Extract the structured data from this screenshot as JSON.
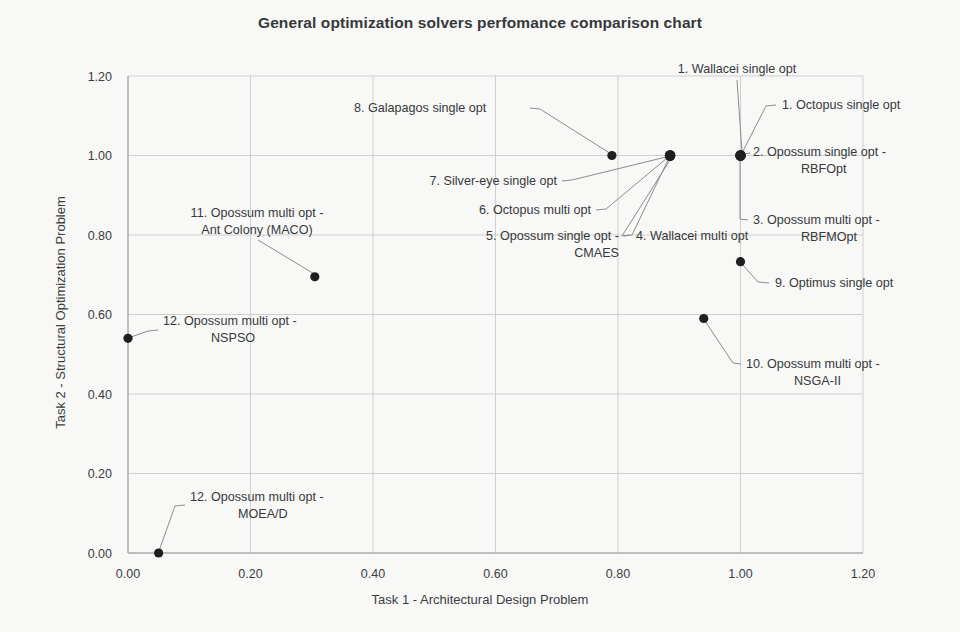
{
  "chart_data": {
    "type": "scatter",
    "title": "General optimization solvers perfomance comparison chart",
    "xlabel": "Task 1 - Architectural Design Problem",
    "ylabel": "Task 2 - Structural Optimization Problem",
    "xlim": [
      0.0,
      1.2
    ],
    "ylim": [
      0.0,
      1.2
    ],
    "xticks": [
      "0.00",
      "0.20",
      "0.40",
      "0.60",
      "0.80",
      "1.00",
      "1.20"
    ],
    "yticks": [
      "0.00",
      "0.20",
      "0.40",
      "0.60",
      "0.80",
      "1.00",
      "1.20"
    ],
    "xtick_values": [
      0.0,
      0.2,
      0.4,
      0.6,
      0.8,
      1.0,
      1.2
    ],
    "ytick_values": [
      0.0,
      0.2,
      0.4,
      0.6,
      0.8,
      1.0,
      1.2
    ],
    "grid": true,
    "legend": "none",
    "marker_color": "#1f1f1f",
    "grid_color": "#cfcfcf",
    "points": [
      {
        "label": "1. Wallacei single opt",
        "x": 1.0,
        "y": 1.0
      },
      {
        "label": "1. Octopus single opt",
        "x": 1.0,
        "y": 1.0
      },
      {
        "label": "2. Opossum single opt - RBFOpt",
        "x": 1.0,
        "y": 1.0
      },
      {
        "label": "3. Opossum multi opt - RBFMOpt",
        "x": 1.0,
        "y": 1.0
      },
      {
        "label": "4. Wallacei multi opt",
        "x": 0.885,
        "y": 1.0
      },
      {
        "label": "5. Opossum single opt - CMAES",
        "x": 0.885,
        "y": 1.0
      },
      {
        "label": "6. Octopus multi opt",
        "x": 0.885,
        "y": 1.0
      },
      {
        "label": "7. Silver-eye single opt",
        "x": 0.885,
        "y": 1.0
      },
      {
        "label": "8. Galapagos single opt",
        "x": 0.79,
        "y": 1.0
      },
      {
        "label": "9. Optimus single opt",
        "x": 1.0,
        "y": 0.733
      },
      {
        "label": "10. Opossum multi opt - NSGA-II",
        "x": 0.94,
        "y": 0.59
      },
      {
        "label": "11. Opossum multi opt - Ant Colony (MACO)",
        "x": 0.305,
        "y": 0.695
      },
      {
        "label": "12. Opossum multi opt - NSPSO",
        "x": 0.0,
        "y": 0.54
      },
      {
        "label": "12. Opossum multi opt - MOEA/D",
        "x": 0.05,
        "y": 0.0
      }
    ]
  },
  "annotations": [
    {
      "id": "ann-wallacei-single",
      "lines": [
        "1. Wallacei single opt"
      ],
      "x": 737,
      "y": 73,
      "anchor": "middle",
      "leader": [
        [
          737,
          80
        ],
        [
          742,
          152
        ]
      ]
    },
    {
      "id": "ann-octopus-single",
      "lines": [
        "1. Octopus single opt"
      ],
      "x": 782,
      "y": 109,
      "anchor": "start",
      "leader": [
        [
          776,
          105
        ],
        [
          766,
          106
        ],
        [
          742,
          153
        ]
      ]
    },
    {
      "id": "ann-opossum-rbfopt",
      "lines": [
        "2. Opossum single opt -",
        "RBFOpt"
      ],
      "x": 753,
      "y": 156,
      "anchor": "start",
      "leader": [
        [
          750,
          153
        ],
        [
          743,
          154
        ]
      ]
    },
    {
      "id": "ann-opossum-rbfmopt",
      "lines": [
        "3. Opossum multi opt -",
        "RBFMOpt"
      ],
      "x": 753,
      "y": 224,
      "anchor": "start",
      "leader": [
        [
          748,
          220
        ],
        [
          740,
          219
        ],
        [
          740,
          158
        ]
      ]
    },
    {
      "id": "ann-wallacei-multi",
      "lines": [
        "4. Wallacei multi opt"
      ],
      "x": 636,
      "y": 240,
      "anchor": "start",
      "leader": [
        [
          630,
          235
        ],
        [
          622,
          236
        ],
        [
          670,
          160
        ]
      ]
    },
    {
      "id": "ann-opossum-cmaes",
      "lines": [
        "5. Opossum single opt -",
        "CMAES"
      ],
      "x": 619,
      "y": 240,
      "anchor": "end",
      "leader": [
        [
          624,
          236
        ],
        [
          632,
          235
        ],
        [
          668,
          160
        ]
      ]
    },
    {
      "id": "ann-octopus-multi",
      "lines": [
        "6. Octopus multi opt"
      ],
      "x": 591,
      "y": 214,
      "anchor": "end",
      "leader": [
        [
          596,
          210
        ],
        [
          606,
          209
        ],
        [
          667,
          158
        ]
      ]
    },
    {
      "id": "ann-silvereye-single",
      "lines": [
        "7. Silver-eye single opt"
      ],
      "x": 557,
      "y": 185,
      "anchor": "end",
      "leader": [
        [
          562,
          181
        ],
        [
          572,
          180
        ],
        [
          666,
          157
        ]
      ]
    },
    {
      "id": "ann-galapagos-single",
      "lines": [
        "8. Galapagos single opt"
      ],
      "x": 354,
      "y": 112,
      "anchor": "start",
      "leader": [
        [
          530,
          108
        ],
        [
          540,
          109
        ],
        [
          608,
          152
        ]
      ]
    },
    {
      "id": "ann-optimus-single",
      "lines": [
        "9. Optimus single opt"
      ],
      "x": 775,
      "y": 287,
      "anchor": "start",
      "leader": [
        [
          769,
          283
        ],
        [
          758,
          282
        ],
        [
          741,
          263
        ]
      ]
    },
    {
      "id": "ann-nsga2",
      "lines": [
        "10. Opossum multi opt -",
        "NSGA-II"
      ],
      "x": 746,
      "y": 368,
      "anchor": "start",
      "leader": [
        [
          741,
          364
        ],
        [
          733,
          363
        ],
        [
          703,
          318
        ]
      ]
    },
    {
      "id": "ann-maco",
      "lines": [
        "11. Opossum multi opt -",
        "Ant Colony (MACO)"
      ],
      "x": 257,
      "y": 217,
      "anchor": "middle",
      "leader": [
        [
          258,
          240
        ],
        [
          316,
          275
        ]
      ]
    },
    {
      "id": "ann-nspso",
      "lines": [
        "12. Opossum multi opt -",
        "NSPSO"
      ],
      "x": 163,
      "y": 325,
      "anchor": "start",
      "leader": [
        [
          158,
          330
        ],
        [
          148,
          331
        ],
        [
          131,
          337
        ]
      ]
    },
    {
      "id": "ann-moead",
      "lines": [
        "12. Opossum multi opt -",
        "MOEA/D"
      ],
      "x": 190,
      "y": 501,
      "anchor": "start",
      "leader": [
        [
          185,
          505
        ],
        [
          175,
          506
        ],
        [
          159,
          551
        ]
      ]
    }
  ],
  "plot_geometry": {
    "left": 128,
    "right": 863,
    "top": 76,
    "bottom": 553
  }
}
